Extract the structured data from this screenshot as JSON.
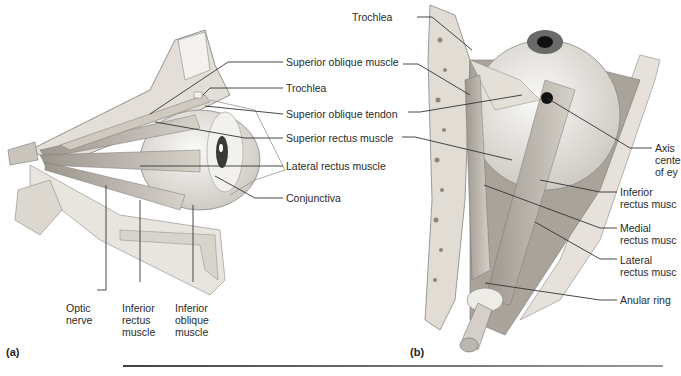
{
  "figure": {
    "panels": [
      {
        "tag": "(a)",
        "view": "lateral view of right eye",
        "labels": {
          "superior_oblique_muscle": "Superior oblique muscle",
          "trochlea": "Trochlea",
          "superior_oblique_tendon": "Superior oblique tendon",
          "superior_rectus_muscle": "Superior rectus muscle",
          "lateral_rectus_muscle": "Lateral rectus muscle",
          "conjunctiva": "Conjunctiva",
          "optic_nerve": [
            "Optic",
            "nerve"
          ],
          "inferior_rectus_muscle": [
            "Inferior",
            "rectus",
            "muscle"
          ],
          "inferior_oblique_muscle": [
            "Inferior",
            "oblique",
            "muscle"
          ]
        }
      },
      {
        "tag": "(b)",
        "view": "superior view of right eye",
        "labels": {
          "trochlea": "Trochlea",
          "axis": [
            "Axis",
            "cente",
            "of ey"
          ],
          "inferior_rectus_muscle": [
            "Inferior",
            "rectus musc"
          ],
          "medial_rectus_muscle": [
            "Medial",
            "rectus musc"
          ],
          "lateral_rectus_muscle": [
            "Lateral",
            "rectus musc"
          ],
          "anular_ring": "Anular ring"
        }
      }
    ]
  },
  "colors": {
    "background": "#ffffff",
    "leader_line": "#333333",
    "muscle": "#b9b3ab",
    "bone": "#d8d4cc",
    "eyeball": "#ececea",
    "iris": "#6a6a6a",
    "pupil": "#111111"
  }
}
